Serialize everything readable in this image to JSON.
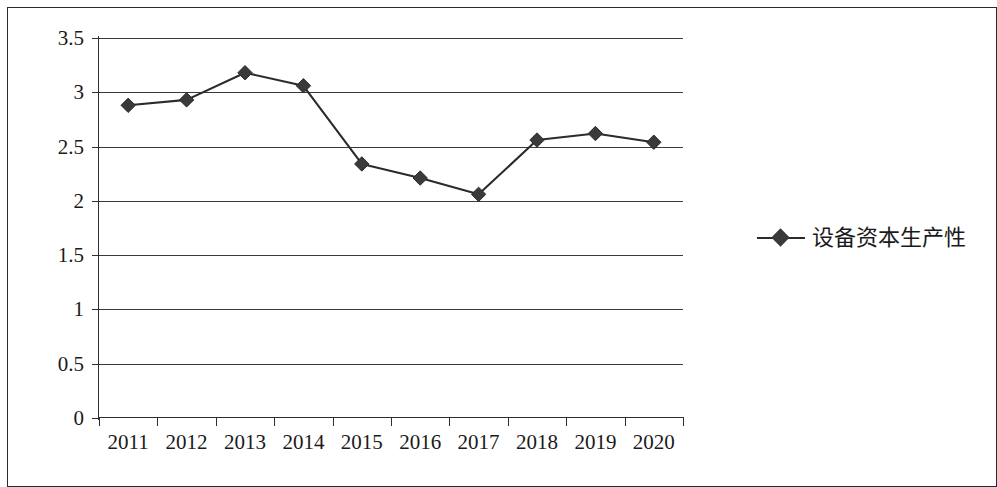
{
  "chart_data": {
    "type": "line",
    "title": "",
    "subtitle": "",
    "xlabel": "",
    "ylabel": "",
    "categories": [
      "2011",
      "2012",
      "2013",
      "2014",
      "2015",
      "2016",
      "2017",
      "2018",
      "2019",
      "2020"
    ],
    "series": [
      {
        "name": "设备资本生产性",
        "values": [
          2.88,
          2.93,
          3.18,
          3.06,
          2.34,
          2.21,
          2.06,
          2.56,
          2.62,
          2.54
        ],
        "marker": "diamond",
        "color": "#3a3a3a"
      }
    ],
    "ylim": [
      0,
      3.5
    ],
    "y_ticks": [
      "0",
      "0.5",
      "1",
      "1.5",
      "2",
      "2.5",
      "3",
      "3.5"
    ],
    "y_tick_values": [
      0,
      0.5,
      1,
      1.5,
      2,
      2.5,
      3,
      3.5
    ],
    "grid": true,
    "grid_axis": "y",
    "legend": {
      "position": "right",
      "entries": [
        {
          "label": "设备资本生产性",
          "marker": "line-diamond",
          "color": "#3a3a3a"
        }
      ]
    },
    "colors": {
      "line": "#2b2b2b",
      "marker": "#3a3a3a",
      "grid": "#3a3a3a",
      "axis": "#2f2f2f",
      "frame": "#2a2a2a",
      "text": "#1a1a1a",
      "background": "#ffffff"
    }
  }
}
